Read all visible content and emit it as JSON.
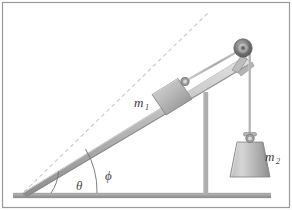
{
  "figure": {
    "name": "inclined-plane-pulley-diagram",
    "width": 292,
    "height": 210,
    "background_color": "#ffffff",
    "border_color": "#9a9a9a"
  },
  "labels": {
    "mass_block": "m",
    "mass_block_sub": "1",
    "mass_hanging": "m",
    "mass_hanging_sub": "2",
    "angle_theta": "θ",
    "angle_phi": "ϕ"
  },
  "colors": {
    "ramp_light": "#d8d8d8",
    "ramp_mid": "#b4b4b4",
    "ramp_dark": "#8f8f8f",
    "ground": "#a9a9a9",
    "ground_edge": "#8a8a8a",
    "block_light": "#d2d2d2",
    "block_dark": "#8e8e8e",
    "weight_light": "#cfcfcf",
    "weight_dark": "#9a9a9a",
    "pulley_outer": "#6e6e6e",
    "pulley_inner": "#b8b8b8",
    "rope": "#b0b0b0",
    "dashed_line": "#c9c9c9",
    "post": "#b2b2b2",
    "arc": "#6f6f6f",
    "text": "#3a3a3a"
  },
  "geometry": {
    "ramp_base_x": 22,
    "ramp_base_y": 193,
    "ramp_top_x": 246,
    "ramp_top_y": 56,
    "dashed_start_x": 24,
    "dashed_start_y": 192,
    "dashed_end_x": 208,
    "dashed_end_y": 13,
    "ground_left_x": 13,
    "ground_right_x": 271,
    "ground_y": 194,
    "post_x": 206,
    "pulley_cx": 243,
    "pulley_cy": 48,
    "pulley_r": 9,
    "rope_vertical_x": 250,
    "block_center_x": 170,
    "block_center_y": 93,
    "weight_center_x": 250,
    "weight_center_y": 157,
    "theta_deg": 31,
    "phi_deg": 44
  },
  "elements": {
    "ramp": "inclined-ramp",
    "ground": "ground-surface",
    "post": "vertical-support-post",
    "pulley": "pulley-wheel",
    "rope_incline": "rope-segment-incline",
    "rope_vertical": "rope-segment-vertical",
    "block": "block-mass-1",
    "block_ring": "block-attachment-ring",
    "weight": "hanging-weight-mass-2",
    "weight_hook": "weight-hook-ring",
    "dashed": "dashed-reference-line",
    "arc_theta": "angle-arc-theta",
    "arc_phi": "angle-arc-phi"
  }
}
